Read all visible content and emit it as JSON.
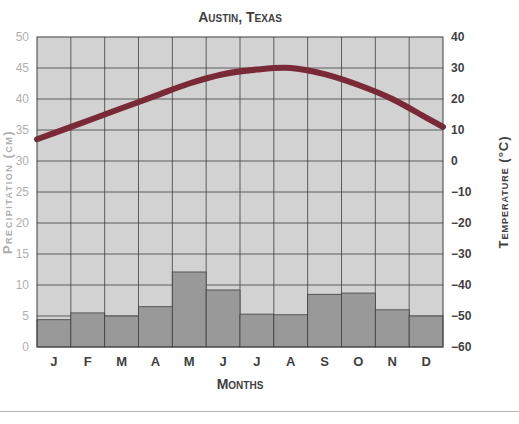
{
  "chart_data": {
    "type": "bar",
    "title": "Austin, Texas",
    "xlabel": "Months",
    "ylabel": "Precipitation (cm)",
    "y2label": "Temperature (°C)",
    "categories": [
      "J",
      "F",
      "M",
      "A",
      "M",
      "J",
      "J",
      "A",
      "S",
      "O",
      "N",
      "D"
    ],
    "ylim": [
      0,
      50
    ],
    "y2lim": [
      -60,
      40
    ],
    "yticks": [
      0,
      5,
      10,
      15,
      20,
      25,
      30,
      35,
      40,
      45,
      50
    ],
    "y2ticks": [
      -60,
      -50,
      -40,
      -30,
      -20,
      -10,
      0,
      10,
      20,
      30,
      40
    ],
    "grid": true,
    "series": [
      {
        "name": "Precipitation",
        "type": "bar",
        "axis": "left",
        "values": [
          4.4,
          5.5,
          5.0,
          6.5,
          12.1,
          9.2,
          5.3,
          5.2,
          8.5,
          8.7,
          6.0,
          5.0
        ]
      },
      {
        "name": "Temperature",
        "type": "line",
        "axis": "right",
        "values": [
          9,
          13,
          17,
          21,
          25,
          28,
          29.5,
          30,
          28,
          24.5,
          20,
          14
        ],
        "start_value": 7,
        "end_value": 11
      }
    ],
    "colors": {
      "plot_background": "#d2d2d2",
      "bar_fill": "#999999",
      "bar_stroke": "#3f3f3f",
      "grid": "#3f3f3f",
      "temperature_line": "#7a2a36",
      "left_axis_text": "#b0b0b0",
      "right_axis_text": "#3f3f3f",
      "title_text": "#3f3f3f"
    }
  }
}
